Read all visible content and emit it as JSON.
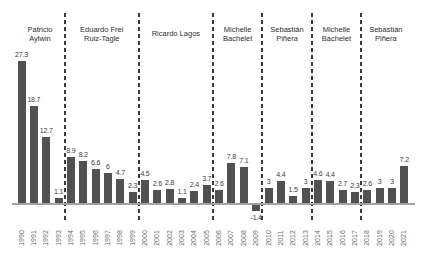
{
  "chart_data": {
    "type": "bar",
    "title": "",
    "xlabel": "",
    "ylabel": "",
    "categories": [
      "1990",
      "1991",
      "1992",
      "1993",
      "1994",
      "1995",
      "1996",
      "1997",
      "1998",
      "1999",
      "2000",
      "2001",
      "2002",
      "2003",
      "2004",
      "2005",
      "2006",
      "2007",
      "2008",
      "2009",
      "2010",
      "2011",
      "2012",
      "2013",
      "2014",
      "2015",
      "2016",
      "2017",
      "2018",
      "2019",
      "2020",
      "2021"
    ],
    "values": [
      27.3,
      18.7,
      12.7,
      1.1,
      8.9,
      8.2,
      6.6,
      6,
      4.7,
      2.3,
      4.5,
      2.6,
      2.8,
      1.1,
      2.4,
      3.7,
      2.6,
      7.8,
      7.1,
      -1.4,
      3,
      4.4,
      1.5,
      3,
      4.6,
      4.4,
      2.7,
      2.3,
      2.6,
      3,
      3,
      7.2
    ],
    "value_labels": [
      "27.3",
      "18.7",
      "12.7",
      "1.1",
      "8.9",
      "8.2",
      "6.6",
      "6",
      "4.7",
      "2.3",
      "4.5",
      "2.6",
      "2.8",
      "1.1",
      "2.4",
      "3.7",
      "2.6",
      "7.8",
      "7.1",
      "-1.4",
      "3",
      "4.4",
      "1.5",
      "3",
      "4.6",
      "4.4",
      "2.7",
      "2.3",
      "2.6",
      "3",
      "3",
      "7.2"
    ],
    "ylim": [
      -2,
      28
    ],
    "grid": false,
    "legend": "none",
    "bar_color": "#515151",
    "axis_color": "#a3a3a3",
    "divider_color": "#3a3a3a",
    "value_label_color": "#3c3c3c",
    "year_label_color": "#6b6b6b",
    "president_label_color": "#2e2e2e",
    "annotations": [
      {
        "lines": [
          "Patricio",
          "Aylwin"
        ],
        "start_year": "1990",
        "end_year": "1993"
      },
      {
        "lines": [
          "Eduardo Frei",
          "Ruiz-Tagle"
        ],
        "start_year": "1994",
        "end_year": "1999"
      },
      {
        "lines": [
          "Ricardo Lagos"
        ],
        "start_year": "2000",
        "end_year": "2005"
      },
      {
        "lines": [
          "Michelle",
          "Bachelet"
        ],
        "start_year": "2006",
        "end_year": "2009"
      },
      {
        "lines": [
          "Sebastián",
          "Piñera"
        ],
        "start_year": "2010",
        "end_year": "2013"
      },
      {
        "lines": [
          "Michelle",
          "Bachelet"
        ],
        "start_year": "2014",
        "end_year": "2017"
      },
      {
        "lines": [
          "Sebastián",
          "Piñera"
        ],
        "start_year": "2018",
        "end_year": "2021"
      }
    ]
  }
}
